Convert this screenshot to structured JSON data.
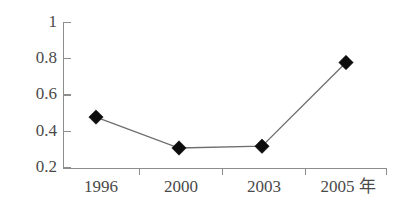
{
  "chart_data": {
    "type": "line",
    "title": "",
    "subtitle": "",
    "xlabel": "年",
    "ylabel": "",
    "categories": [
      "1996",
      "2000",
      "2003",
      "2005 年"
    ],
    "x_tick_labels": [
      "1996",
      "2000",
      "2003",
      "2005 年"
    ],
    "values": [
      0.48,
      0.31,
      0.32,
      0.78
    ],
    "series": [
      {
        "name": "",
        "values": [
          0.48,
          0.31,
          0.32,
          0.78
        ]
      }
    ],
    "y_tick_labels": [
      "1",
      "0.8",
      "0.6",
      "0.4",
      "0.2"
    ],
    "y_tick_values": [
      1,
      0.8,
      0.6,
      0.4,
      0.2
    ],
    "ylim": [
      0.2,
      1.0
    ],
    "grid": false,
    "legend": false,
    "legend_position": "none",
    "marker": "diamond",
    "annotations": [],
    "colors": {
      "line": "#6e6e6e",
      "marker": "#0d0d0d",
      "axis": "#8d8d8d",
      "tick_text": "#4a4a4a",
      "background": "#ffffff"
    }
  },
  "axis": {
    "y_labels": {
      "t0": "1",
      "t1": "0.8",
      "t2": "0.6",
      "t3": "0.4",
      "t4": "0.2"
    },
    "x_labels": {
      "t0": "1996",
      "t1": "2000",
      "t2": "2003",
      "t3": "2005 年"
    }
  }
}
